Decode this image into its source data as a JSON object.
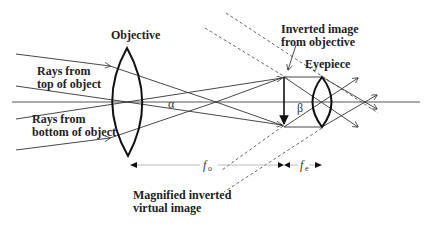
{
  "diagram": {
    "labels": {
      "objective": "Objective",
      "eyepiece": "Eyepiece",
      "rays_top_line1": "Rays from",
      "rays_top_line2": "top of object",
      "rays_bottom_line1": "Rays from",
      "rays_bottom_line2": "bottom of object",
      "inverted_line1": "Inverted image",
      "inverted_line2": "from objective",
      "magnified_line1": "Magnified inverted",
      "magnified_line2": "virtual image",
      "alpha": "α",
      "beta": "β",
      "fo_main": "f",
      "fo_sub": "o",
      "fe_main": "f",
      "fe_sub": "e"
    },
    "colors": {
      "ink": "#222222",
      "dashed": "#555555",
      "dimension": "#bbbbbb"
    }
  }
}
